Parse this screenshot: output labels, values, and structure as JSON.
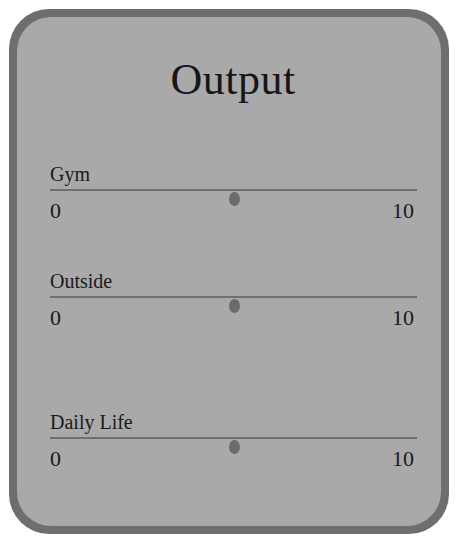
{
  "panel": {
    "title": "Output",
    "colors": {
      "frame_outer": "#6e6e6e",
      "frame_inner": "#a9a9a9",
      "card": "#ffffff",
      "track": "#6f6f6f",
      "knob": "#6b6b6b"
    }
  },
  "sliders": [
    {
      "label": "Gym",
      "min": "0",
      "max": "10",
      "value": 5
    },
    {
      "label": "Outside",
      "min": "0",
      "max": "10",
      "value": 5
    },
    {
      "label": "Daily Life",
      "min": "0",
      "max": "10",
      "value": 5
    }
  ]
}
